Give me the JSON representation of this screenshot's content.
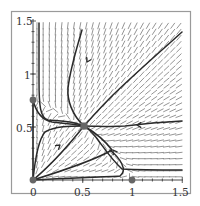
{
  "chart_data": {
    "type": "line",
    "subtype": "phase-portrait-direction-field",
    "title": "",
    "xlabel": "",
    "ylabel": "",
    "xlim": [
      0,
      1.5
    ],
    "ylim": [
      0,
      1.5
    ],
    "grid": false,
    "legend": null,
    "x_ticks": [
      {
        "value": 0,
        "label": "0"
      },
      {
        "value": 0.5,
        "label": "0.5"
      },
      {
        "value": 1,
        "label": "1"
      },
      {
        "value": 1.5,
        "label": "1.5"
      }
    ],
    "y_ticks": [
      {
        "value": 0.5,
        "label": "0.5"
      },
      {
        "value": 1,
        "label": "1"
      },
      {
        "value": 1.5,
        "label": "1.5"
      }
    ],
    "equilibria": [
      {
        "x": 0,
        "y": 0,
        "type": "unstable-node"
      },
      {
        "x": 0,
        "y": 0.75,
        "type": "saddle"
      },
      {
        "x": 1,
        "y": 0,
        "type": "saddle"
      },
      {
        "x": 0.5,
        "y": 0.5,
        "type": "stable-node"
      }
    ],
    "trajectories": [
      {
        "name": "left-vertical-from-top",
        "points": [
          [
            0.06,
            1.47
          ],
          [
            0.06,
            0.9
          ],
          [
            0.07,
            0.65
          ],
          [
            0.15,
            0.62
          ],
          [
            0.3,
            0.58
          ],
          [
            0.5,
            0.5
          ]
        ]
      },
      {
        "name": "from-upper-mid",
        "points": [
          [
            0.5,
            1.42
          ],
          [
            0.42,
            1.2
          ],
          [
            0.35,
            1.0
          ],
          [
            0.32,
            0.8
          ],
          [
            0.38,
            0.65
          ],
          [
            0.5,
            0.5
          ]
        ]
      },
      {
        "name": "diagonal-from-upper-right",
        "points": [
          [
            1.5,
            1.42
          ],
          [
            1.2,
            1.15
          ],
          [
            0.95,
            0.92
          ],
          [
            0.7,
            0.68
          ],
          [
            0.5,
            0.5
          ]
        ]
      },
      {
        "name": "from-right-upper",
        "points": [
          [
            1.5,
            0.55
          ],
          [
            1.1,
            0.52
          ],
          [
            0.85,
            0.5
          ],
          [
            0.7,
            0.5
          ],
          [
            0.5,
            0.5
          ]
        ]
      },
      {
        "name": "from-right-lower-via-separatrix",
        "points": [
          [
            1.5,
            0.1
          ],
          [
            1.0,
            0.11
          ],
          [
            0.85,
            0.12
          ],
          [
            0.75,
            0.28
          ],
          [
            0.68,
            0.4
          ],
          [
            0.5,
            0.5
          ]
        ]
      },
      {
        "name": "origin-to-node-diagonal",
        "points": [
          [
            0.0,
            0.0
          ],
          [
            0.2,
            0.16
          ],
          [
            0.35,
            0.3
          ],
          [
            0.5,
            0.5
          ]
        ]
      },
      {
        "name": "origin-to-node-lower",
        "points": [
          [
            0.0,
            0.0
          ],
          [
            0.3,
            0.12
          ],
          [
            0.6,
            0.28
          ],
          [
            0.8,
            0.4
          ],
          [
            0.5,
            0.5
          ]
        ]
      },
      {
        "name": "origin-to-node-upper",
        "points": [
          [
            0.0,
            0.0
          ],
          [
            0.05,
            0.3
          ],
          [
            0.12,
            0.45
          ],
          [
            0.3,
            0.55
          ],
          [
            0.5,
            0.5
          ]
        ]
      },
      {
        "name": "origin-along-x-axis",
        "points": [
          [
            0.0,
            0.0
          ],
          [
            0.5,
            0.02
          ],
          [
            0.85,
            0.03
          ],
          [
            0.95,
            0.1
          ],
          [
            0.8,
            0.4
          ],
          [
            0.5,
            0.5
          ]
        ]
      },
      {
        "name": "y-axis-separatrix",
        "points": [
          [
            0.0,
            0.0
          ],
          [
            0.0,
            0.75
          ]
        ]
      }
    ],
    "direction_field": "dense field of short gray slope segments over the full domain"
  },
  "axes": {
    "x_labels": [
      "0",
      "0.5",
      "1",
      "1.5"
    ],
    "y_labels": [
      "0.5",
      "1",
      "1.5"
    ]
  },
  "colors": {
    "trajectory": "#2a2a2a",
    "field": "#7a7a7a",
    "equilibrium": "#666666",
    "frame": "#9a9a9a"
  }
}
